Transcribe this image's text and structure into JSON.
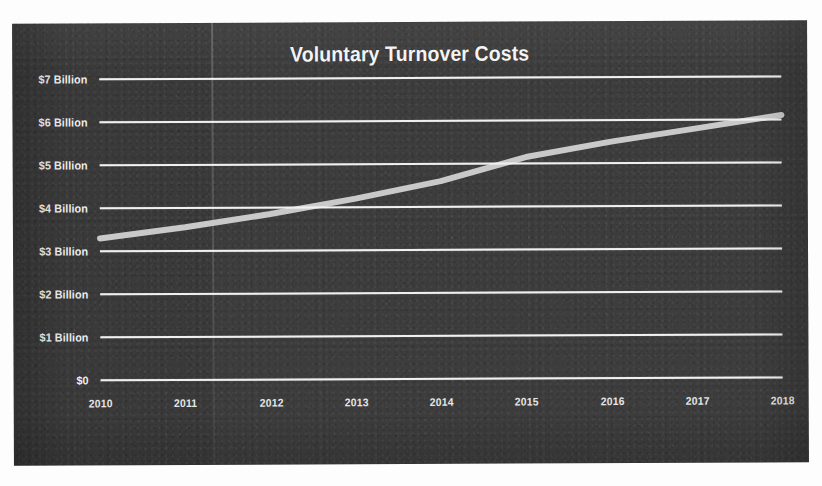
{
  "chart_data": {
    "type": "line",
    "title": "Voluntary Turnover Costs",
    "xlabel": "",
    "ylabel": "",
    "x": [
      2010,
      2011,
      2012,
      2013,
      2014,
      2015,
      2016,
      2017,
      2018
    ],
    "categories": [
      "2010",
      "2011",
      "2012",
      "2013",
      "2014",
      "2015",
      "2016",
      "2017",
      "2018"
    ],
    "values": [
      3.3,
      3.55,
      3.85,
      4.2,
      4.6,
      5.15,
      5.5,
      5.8,
      6.1
    ],
    "series": [
      {
        "name": "Voluntary Turnover Costs",
        "values": [
          3.3,
          3.55,
          3.85,
          4.2,
          4.6,
          5.15,
          5.5,
          5.8,
          6.1
        ],
        "color": "#c9c9c9"
      }
    ],
    "ylim": [
      0,
      7
    ],
    "yticks": [
      0,
      1,
      2,
      3,
      4,
      5,
      6,
      7
    ],
    "ytick_labels": [
      "$0",
      "$1 Billion",
      "$2 Billion",
      "$3 Billion",
      "$4 Billion",
      "$5 Billion",
      "$6 Billion",
      "$7 Billion"
    ],
    "xlim": [
      2010,
      2018
    ],
    "grid": "horizontal",
    "legend": "none",
    "units": "USD Billions",
    "colors": {
      "panel_background": "#3a3a3a",
      "gridline": "#f0f0f0",
      "line": "#c9c9c9",
      "title_text": "#f4f4f4",
      "tick_text": "#ededed",
      "page_background": "#ffffff"
    }
  }
}
